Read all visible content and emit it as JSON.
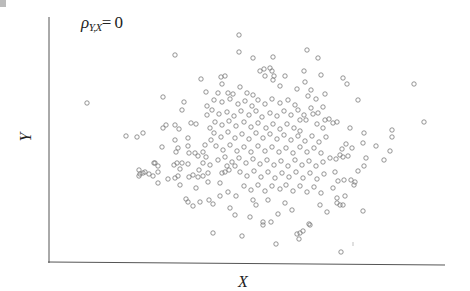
{
  "chart_data": {
    "type": "scatter",
    "title": "",
    "annotation": {
      "symbol": "ρ",
      "subscript": "Y,X",
      "equals": "= 0"
    },
    "xlabel": "X",
    "ylabel": "Y",
    "grid": false,
    "legend": null,
    "tick_labels": [],
    "marker": {
      "shape": "open-circle",
      "radius": 2.2,
      "stroke": "#7a7a7a"
    },
    "axis_color": "#555555",
    "axes_px": {
      "left_x": 49,
      "top_y": 17,
      "bottom_y": 263,
      "right_x": 445
    },
    "points_px": [
      [
        239,
        35
      ],
      [
        239,
        52
      ],
      [
        253,
        58
      ],
      [
        273,
        57
      ],
      [
        307,
        50
      ],
      [
        175,
        55
      ],
      [
        318,
        58
      ],
      [
        201,
        79
      ],
      [
        221,
        77
      ],
      [
        225,
        76
      ],
      [
        260,
        71
      ],
      [
        264,
        69
      ],
      [
        270,
        68
      ],
      [
        272,
        71
      ],
      [
        274,
        76
      ],
      [
        265,
        76
      ],
      [
        273,
        80
      ],
      [
        222,
        84
      ],
      [
        218,
        93
      ],
      [
        206,
        92
      ],
      [
        240,
        87
      ],
      [
        253,
        95
      ],
      [
        285,
        76
      ],
      [
        304,
        71
      ],
      [
        305,
        82
      ],
      [
        280,
        86
      ],
      [
        297,
        89
      ],
      [
        228,
        93
      ],
      [
        247,
        93
      ],
      [
        233,
        94
      ],
      [
        321,
        75
      ],
      [
        343,
        78
      ],
      [
        347,
        84
      ],
      [
        414,
        84
      ],
      [
        311,
        90
      ],
      [
        325,
        94
      ],
      [
        308,
        96
      ],
      [
        316,
        99
      ],
      [
        358,
        100
      ],
      [
        311,
        108
      ],
      [
        323,
        107
      ],
      [
        318,
        113
      ],
      [
        304,
        115
      ],
      [
        313,
        114
      ],
      [
        300,
        120
      ],
      [
        306,
        120
      ],
      [
        317,
        124
      ],
      [
        325,
        120
      ],
      [
        329,
        119
      ],
      [
        333,
        123
      ],
      [
        337,
        122
      ],
      [
        424,
        122
      ],
      [
        350,
        128
      ],
      [
        392,
        130
      ],
      [
        323,
        128
      ],
      [
        163,
        97
      ],
      [
        87,
        103
      ],
      [
        184,
        102
      ],
      [
        182,
        110
      ],
      [
        126,
        136
      ],
      [
        137,
        137
      ],
      [
        143,
        133
      ],
      [
        163,
        128
      ],
      [
        166,
        125
      ],
      [
        175,
        125
      ],
      [
        179,
        129
      ],
      [
        191,
        123
      ],
      [
        196,
        124
      ],
      [
        207,
        106
      ],
      [
        207,
        115
      ],
      [
        210,
        128
      ],
      [
        211,
        140
      ],
      [
        162,
        147
      ],
      [
        175,
        140
      ],
      [
        178,
        148
      ],
      [
        176,
        152
      ],
      [
        188,
        138
      ],
      [
        188,
        146
      ],
      [
        189,
        153
      ],
      [
        195,
        153
      ],
      [
        198,
        156
      ],
      [
        203,
        152
      ],
      [
        205,
        145
      ],
      [
        206,
        157
      ],
      [
        154,
        163
      ],
      [
        174,
        165
      ],
      [
        177,
        163
      ],
      [
        182,
        163
      ],
      [
        188,
        164
      ],
      [
        203,
        163
      ],
      [
        180,
        169
      ],
      [
        199,
        170
      ],
      [
        158,
        172
      ],
      [
        153,
        176
      ],
      [
        149,
        174
      ],
      [
        210,
        165
      ],
      [
        208,
        173
      ],
      [
        364,
        133
      ],
      [
        392,
        137
      ],
      [
        363,
        143
      ],
      [
        346,
        144
      ],
      [
        352,
        148
      ],
      [
        342,
        149
      ],
      [
        376,
        146
      ],
      [
        390,
        151
      ],
      [
        340,
        155
      ],
      [
        343,
        157
      ],
      [
        348,
        156
      ],
      [
        336,
        159
      ],
      [
        330,
        158
      ],
      [
        366,
        158
      ],
      [
        384,
        160
      ],
      [
        364,
        166
      ],
      [
        358,
        171
      ],
      [
        335,
        172
      ],
      [
        344,
        180
      ],
      [
        338,
        181
      ],
      [
        351,
        180
      ],
      [
        355,
        182
      ],
      [
        354,
        185
      ],
      [
        333,
        188
      ],
      [
        337,
        198
      ],
      [
        345,
        196
      ],
      [
        337,
        203
      ],
      [
        340,
        205
      ],
      [
        343,
        205
      ],
      [
        363,
        211
      ],
      [
        139,
        170
      ],
      [
        140,
        174
      ],
      [
        139,
        176
      ],
      [
        143,
        173
      ],
      [
        145,
        172
      ],
      [
        155,
        163
      ],
      [
        158,
        166
      ],
      [
        168,
        179
      ],
      [
        178,
        176
      ],
      [
        175,
        178
      ],
      [
        180,
        185
      ],
      [
        158,
        183
      ],
      [
        189,
        177
      ],
      [
        193,
        175
      ],
      [
        198,
        177
      ],
      [
        203,
        176
      ],
      [
        196,
        188
      ],
      [
        208,
        182
      ],
      [
        220,
        183
      ],
      [
        209,
        200
      ],
      [
        200,
        202
      ],
      [
        188,
        202
      ],
      [
        193,
        206
      ],
      [
        213,
        204
      ],
      [
        186,
        199
      ],
      [
        213,
        233
      ],
      [
        222,
        173
      ],
      [
        225,
        172
      ],
      [
        227,
        166
      ],
      [
        229,
        170
      ],
      [
        235,
        166
      ],
      [
        236,
        196
      ],
      [
        235,
        215
      ],
      [
        253,
        200
      ],
      [
        250,
        217
      ],
      [
        263,
        222
      ],
      [
        271,
        222
      ],
      [
        263,
        225
      ],
      [
        242,
        236
      ],
      [
        276,
        244
      ],
      [
        297,
        234
      ],
      [
        303,
        231
      ],
      [
        299,
        239
      ],
      [
        310,
        225
      ],
      [
        280,
        189
      ],
      [
        268,
        200
      ],
      [
        309,
        224
      ],
      [
        300,
        233
      ],
      [
        341,
        252
      ],
      [
        214,
        100
      ],
      [
        222,
        102
      ],
      [
        230,
        99
      ],
      [
        238,
        104
      ],
      [
        245,
        101
      ],
      [
        252,
        106
      ],
      [
        258,
        100
      ],
      [
        265,
        104
      ],
      [
        272,
        99
      ],
      [
        280,
        103
      ],
      [
        288,
        100
      ],
      [
        295,
        105
      ],
      [
        212,
        110
      ],
      [
        219,
        114
      ],
      [
        227,
        112
      ],
      [
        234,
        116
      ],
      [
        241,
        111
      ],
      [
        249,
        115
      ],
      [
        256,
        111
      ],
      [
        262,
        117
      ],
      [
        270,
        113
      ],
      [
        277,
        116
      ],
      [
        284,
        111
      ],
      [
        291,
        115
      ],
      [
        298,
        110
      ],
      [
        215,
        122
      ],
      [
        222,
        125
      ],
      [
        229,
        121
      ],
      [
        236,
        126
      ],
      [
        244,
        122
      ],
      [
        251,
        127
      ],
      [
        258,
        123
      ],
      [
        266,
        128
      ],
      [
        273,
        124
      ],
      [
        280,
        129
      ],
      [
        287,
        124
      ],
      [
        294,
        128
      ],
      [
        300,
        131
      ],
      [
        214,
        133
      ],
      [
        221,
        137
      ],
      [
        228,
        132
      ],
      [
        235,
        138
      ],
      [
        242,
        134
      ],
      [
        249,
        139
      ],
      [
        256,
        133
      ],
      [
        263,
        138
      ],
      [
        270,
        134
      ],
      [
        277,
        139
      ],
      [
        284,
        135
      ],
      [
        291,
        140
      ],
      [
        298,
        136
      ],
      [
        305,
        141
      ],
      [
        312,
        136
      ],
      [
        319,
        142
      ],
      [
        326,
        137
      ],
      [
        216,
        146
      ],
      [
        223,
        150
      ],
      [
        230,
        145
      ],
      [
        237,
        151
      ],
      [
        244,
        147
      ],
      [
        251,
        152
      ],
      [
        258,
        146
      ],
      [
        265,
        151
      ],
      [
        272,
        147
      ],
      [
        279,
        152
      ],
      [
        286,
        148
      ],
      [
        293,
        153
      ],
      [
        300,
        147
      ],
      [
        307,
        152
      ],
      [
        314,
        148
      ],
      [
        321,
        153
      ],
      [
        218,
        160
      ],
      [
        225,
        157
      ],
      [
        232,
        162
      ],
      [
        239,
        158
      ],
      [
        246,
        163
      ],
      [
        253,
        159
      ],
      [
        260,
        164
      ],
      [
        267,
        160
      ],
      [
        274,
        165
      ],
      [
        281,
        161
      ],
      [
        288,
        166
      ],
      [
        295,
        160
      ],
      [
        302,
        165
      ],
      [
        309,
        161
      ],
      [
        316,
        166
      ],
      [
        323,
        162
      ],
      [
        240,
        172
      ],
      [
        247,
        176
      ],
      [
        254,
        171
      ],
      [
        261,
        177
      ],
      [
        268,
        172
      ],
      [
        275,
        178
      ],
      [
        282,
        173
      ],
      [
        289,
        177
      ],
      [
        296,
        172
      ],
      [
        303,
        178
      ],
      [
        310,
        173
      ],
      [
        317,
        179
      ],
      [
        324,
        174
      ],
      [
        244,
        186
      ],
      [
        251,
        190
      ],
      [
        258,
        185
      ],
      [
        265,
        191
      ],
      [
        272,
        186
      ],
      [
        286,
        185
      ],
      [
        293,
        191
      ],
      [
        300,
        186
      ],
      [
        307,
        192
      ],
      [
        314,
        187
      ],
      [
        321,
        193
      ],
      [
        228,
        192
      ],
      [
        220,
        196
      ],
      [
        256,
        205
      ],
      [
        285,
        203
      ],
      [
        292,
        210
      ],
      [
        320,
        205
      ],
      [
        327,
        212
      ],
      [
        230,
        208
      ],
      [
        278,
        214
      ]
    ]
  }
}
